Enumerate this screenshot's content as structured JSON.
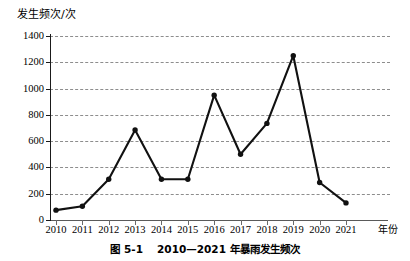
{
  "figure": {
    "caption_label": "图 5-1",
    "caption_text": "2010—2021 年暴雨发生频次"
  },
  "axes": {
    "y_axis_title": "发生频次/次",
    "x_axis_title": "年份"
  },
  "chart_data": {
    "type": "line",
    "xlabel": "年份",
    "ylabel": "发生频次/次",
    "categories": [
      "2010",
      "2011",
      "2012",
      "2013",
      "2014",
      "2015",
      "2016",
      "2017",
      "2018",
      "2019",
      "2020",
      "2021"
    ],
    "values": [
      75,
      105,
      310,
      685,
      310,
      310,
      950,
      500,
      735,
      1250,
      285,
      130
    ],
    "series": [
      {
        "name": "暴雨发生频次",
        "values": [
          75,
          105,
          310,
          685,
          310,
          310,
          950,
          500,
          735,
          1250,
          285,
          130
        ]
      }
    ],
    "ylim": [
      0,
      1400
    ],
    "y_ticks": [
      0,
      200,
      400,
      600,
      800,
      1000,
      1200,
      1400
    ],
    "y_tick_labels": [
      "0",
      "200",
      "400",
      "600",
      "800",
      "1000",
      "1200",
      "1400"
    ],
    "x_ticks": [
      "2010",
      "2011",
      "2012",
      "2013",
      "2014",
      "2015",
      "2016",
      "2017",
      "2018",
      "2019",
      "2020",
      "2021"
    ],
    "grid": true,
    "grid_style": "dashed",
    "grid_axis": "y",
    "legend": null,
    "marker": "circle",
    "line_color": "#111111",
    "marker_color": "#111111",
    "grid_color": "#8d8d8d",
    "background": "#ffffff"
  }
}
